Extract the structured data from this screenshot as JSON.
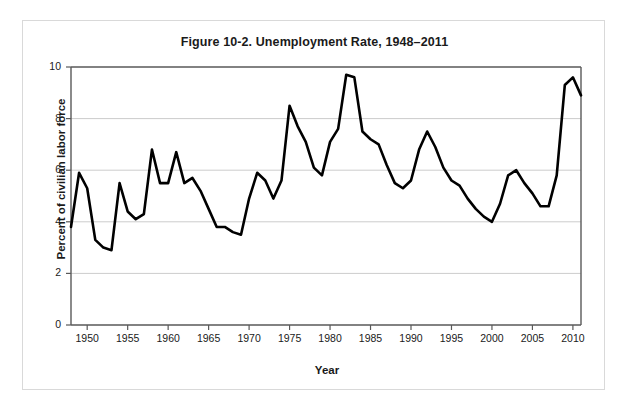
{
  "figure": {
    "title": "Figure 10-2. Unemployment Rate, 1948–2011",
    "xlabel": "Year",
    "ylabel": "Percent of civilian labor force",
    "line_color": "#000000",
    "gridline_color": "#cccccc",
    "axis_color": "#595959",
    "frame_color": "#d9d9d9"
  },
  "axes": {
    "y_ticks": [
      "0",
      "2",
      "4",
      "6",
      "8",
      "10"
    ],
    "x_ticks": [
      "1950",
      "1955",
      "1960",
      "1965",
      "1970",
      "1975",
      "1980",
      "1985",
      "1990",
      "1995",
      "2000",
      "2005",
      "2010"
    ]
  },
  "chart_data": {
    "type": "line",
    "title": "Figure 10-2. Unemployment Rate, 1948–2011",
    "xlabel": "Year",
    "ylabel": "Percent of civilian labor force",
    "xlim": [
      1948,
      2011
    ],
    "ylim": [
      0,
      10
    ],
    "grid": true,
    "legend": null,
    "x": [
      1948,
      1949,
      1950,
      1951,
      1952,
      1953,
      1954,
      1955,
      1956,
      1957,
      1958,
      1959,
      1960,
      1961,
      1962,
      1963,
      1964,
      1965,
      1966,
      1967,
      1968,
      1969,
      1970,
      1971,
      1972,
      1973,
      1974,
      1975,
      1976,
      1977,
      1978,
      1979,
      1980,
      1981,
      1982,
      1983,
      1984,
      1985,
      1986,
      1987,
      1988,
      1989,
      1990,
      1991,
      1992,
      1993,
      1994,
      1995,
      1996,
      1997,
      1998,
      1999,
      2000,
      2001,
      2002,
      2003,
      2004,
      2005,
      2006,
      2007,
      2008,
      2009,
      2010,
      2011
    ],
    "series": [
      {
        "name": "Unemployment rate",
        "values": [
          3.8,
          5.9,
          5.3,
          3.3,
          3.0,
          2.9,
          5.5,
          4.4,
          4.1,
          4.3,
          6.8,
          5.5,
          5.5,
          6.7,
          5.5,
          5.7,
          5.2,
          4.5,
          3.8,
          3.8,
          3.6,
          3.5,
          4.9,
          5.9,
          5.6,
          4.9,
          5.6,
          8.5,
          7.7,
          7.1,
          6.1,
          5.8,
          7.1,
          7.6,
          9.7,
          9.6,
          7.5,
          7.2,
          7.0,
          6.2,
          5.5,
          5.3,
          5.6,
          6.8,
          7.5,
          6.9,
          6.1,
          5.6,
          5.4,
          4.9,
          4.5,
          4.2,
          4.0,
          4.7,
          5.8,
          6.0,
          5.5,
          5.1,
          4.6,
          4.6,
          5.8,
          9.3,
          9.6,
          8.9
        ]
      }
    ]
  }
}
